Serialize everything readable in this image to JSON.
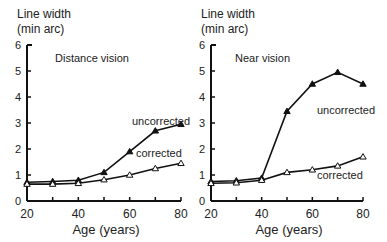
{
  "chart_data": [
    {
      "type": "line",
      "title": "Distance vision",
      "xlabel": "Age (years)",
      "ylabel": "Line width (min arc)",
      "ylabel_line1": "Line width",
      "ylabel_line2": "(min arc)",
      "x": [
        20,
        30,
        40,
        50,
        60,
        70,
        80
      ],
      "xticks": [
        "20",
        "40",
        "60",
        "80"
      ],
      "yticks": [
        "0",
        "1",
        "2",
        "3",
        "4",
        "5",
        "6"
      ],
      "ylim": [
        0,
        6
      ],
      "xlim": [
        20,
        80
      ],
      "grid": false,
      "series": [
        {
          "name": "uncorrected",
          "marker": "filled-triangle",
          "values": [
            0.72,
            0.75,
            0.8,
            1.1,
            1.9,
            2.7,
            2.95
          ]
        },
        {
          "name": "corrected",
          "marker": "open-triangle",
          "values": [
            0.65,
            0.65,
            0.68,
            0.82,
            1.0,
            1.25,
            1.45
          ]
        }
      ]
    },
    {
      "type": "line",
      "title": "Near vision",
      "xlabel": "Age (years)",
      "ylabel": "Line width (min arc)",
      "ylabel_line1": "Line width",
      "ylabel_line2": "(min arc)",
      "x": [
        20,
        30,
        40,
        50,
        60,
        70,
        80
      ],
      "xticks": [
        "20",
        "40",
        "60",
        "80"
      ],
      "yticks": [
        "0",
        "1",
        "2",
        "3",
        "4",
        "5",
        "6"
      ],
      "ylim": [
        0,
        6
      ],
      "xlim": [
        20,
        80
      ],
      "grid": false,
      "series": [
        {
          "name": "uncorrected",
          "marker": "filled-triangle",
          "values": [
            0.75,
            0.78,
            0.88,
            3.45,
            4.5,
            4.95,
            4.5
          ]
        },
        {
          "name": "corrected",
          "marker": "open-triangle",
          "values": [
            0.68,
            0.7,
            0.8,
            1.1,
            1.2,
            1.35,
            1.7
          ]
        }
      ]
    }
  ]
}
